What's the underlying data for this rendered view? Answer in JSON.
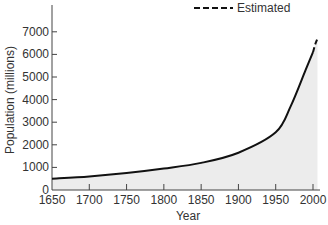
{
  "chart_data": {
    "type": "area",
    "title": "",
    "xlabel": "Year",
    "ylabel": "Population (millions)",
    "xlim": [
      1650,
      2010
    ],
    "ylim": [
      0,
      7500
    ],
    "x_ticks": [
      "1650",
      "1700",
      "1750",
      "1800",
      "1850",
      "1900",
      "1950",
      "2000"
    ],
    "y_ticks": [
      "0",
      "1000",
      "2000",
      "3000",
      "4000",
      "5000",
      "6000",
      "7000"
    ],
    "grid": false,
    "legend": {
      "position": "top-right",
      "entries": [
        {
          "label": "Estimated",
          "style": "dashed"
        }
      ]
    },
    "series": [
      {
        "name": "World population",
        "style": "solid",
        "x": [
          1650,
          1700,
          1750,
          1800,
          1850,
          1900,
          1950,
          1970,
          1990,
          2000
        ],
        "values": [
          500,
          600,
          750,
          950,
          1200,
          1650,
          2550,
          3700,
          5300,
          6100
        ]
      },
      {
        "name": "Estimated",
        "style": "dashed",
        "x": [
          2000,
          2003,
          2006
        ],
        "values": [
          6100,
          6450,
          6700
        ]
      }
    ]
  },
  "legend": {
    "label": "Estimated"
  },
  "axes": {
    "xlabel": "Year",
    "ylabel": "Population (millions)"
  },
  "colors": {
    "line": "#111111",
    "fill": "#ececec",
    "axis": "#444444",
    "text": "#333333"
  }
}
